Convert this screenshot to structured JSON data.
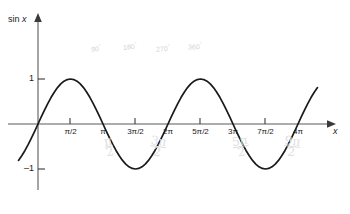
{
  "chart_data": {
    "type": "line",
    "title": "",
    "subtitle": "",
    "function": "sin x",
    "ylabel": "sin x",
    "xlabel": "x",
    "xlim_radians": [
      -0.35,
      4.35
    ],
    "ylim": [
      -1.55,
      1.6
    ],
    "grid": false,
    "legend": false,
    "series": [
      {
        "name": "sin x",
        "color": "#1a1a1a",
        "x_units": "radians (multiples of pi)",
        "x": [
          -0.3,
          -0.25,
          -0.2,
          -0.15,
          -0.1,
          -0.05,
          0.0,
          0.05,
          0.1,
          0.15,
          0.2,
          0.25,
          0.3,
          0.35,
          0.4,
          0.45,
          0.5,
          0.55,
          0.6,
          0.65,
          0.7,
          0.75,
          0.8,
          0.85,
          0.9,
          0.95,
          1.0,
          1.05,
          1.1,
          1.15,
          1.2,
          1.25,
          1.3,
          1.35,
          1.4,
          1.45,
          1.5,
          1.55,
          1.6,
          1.65,
          1.7,
          1.75,
          1.8,
          1.85,
          1.9,
          1.95,
          2.0,
          2.05,
          2.1,
          2.15,
          2.2,
          2.25,
          2.3,
          2.35,
          2.4,
          2.45,
          2.5,
          2.55,
          2.6,
          2.65,
          2.7,
          2.75,
          2.8,
          2.85,
          2.9,
          2.95,
          3.0,
          3.05,
          3.1,
          3.15,
          3.2,
          3.25,
          3.3,
          3.35,
          3.4,
          3.45,
          3.5,
          3.55,
          3.6,
          3.65,
          3.7,
          3.75,
          3.8,
          3.85,
          3.9,
          3.95,
          4.0,
          4.05,
          4.1,
          4.15,
          4.2,
          4.25,
          4.3
        ],
        "y": [
          -0.809,
          -0.707,
          -0.588,
          -0.454,
          -0.309,
          -0.156,
          0.0,
          0.156,
          0.309,
          0.454,
          0.588,
          0.707,
          0.809,
          0.891,
          0.951,
          0.988,
          1.0,
          0.988,
          0.951,
          0.891,
          0.809,
          0.707,
          0.588,
          0.454,
          0.309,
          0.156,
          0.0,
          -0.156,
          -0.309,
          -0.454,
          -0.588,
          -0.707,
          -0.809,
          -0.891,
          -0.951,
          -0.988,
          -1.0,
          -0.988,
          -0.951,
          -0.891,
          -0.809,
          -0.707,
          -0.588,
          -0.454,
          -0.309,
          -0.156,
          0.0,
          0.156,
          0.309,
          0.454,
          0.588,
          0.707,
          0.809,
          0.891,
          0.951,
          0.988,
          1.0,
          0.988,
          0.951,
          0.891,
          0.809,
          0.707,
          0.588,
          0.454,
          0.309,
          0.156,
          0.0,
          -0.156,
          -0.309,
          -0.454,
          -0.588,
          -0.707,
          -0.809,
          -0.891,
          -0.951,
          -0.988,
          -1.0,
          -0.988,
          -0.951,
          -0.891,
          -0.809,
          -0.707,
          -0.588,
          -0.454,
          -0.309,
          -0.156,
          0.0,
          0.156,
          0.309,
          0.454,
          0.588,
          0.707,
          0.809
        ]
      }
    ],
    "x_ticks": [
      {
        "value": 0.5,
        "label": "π/2"
      },
      {
        "value": 1.0,
        "label": "π"
      },
      {
        "value": 1.5,
        "label": "3π/2"
      },
      {
        "value": 2.0,
        "label": "2π"
      },
      {
        "value": 2.5,
        "label": "5π/2"
      },
      {
        "value": 3.0,
        "label": "3π"
      },
      {
        "value": 3.5,
        "label": "7π/2"
      },
      {
        "value": 4.0,
        "label": "4π"
      }
    ],
    "y_ticks": [
      {
        "value": 1,
        "label": "1"
      },
      {
        "value": -1,
        "label": "–1"
      }
    ],
    "annotations_degrees": [
      {
        "label": "90",
        "degree_symbol": "°",
        "x": 0.5
      },
      {
        "label": "180",
        "degree_symbol": "°",
        "x": 1.0
      },
      {
        "label": "270",
        "degree_symbol": "°",
        "x": 1.5
      },
      {
        "label": "360",
        "degree_symbol": "°",
        "x": 2.0
      }
    ],
    "annotations_pencil": [
      {
        "numerator": "π",
        "denominator": "2",
        "x": 1.15
      },
      {
        "numerator": "3π",
        "denominator": "2",
        "x": 1.85
      },
      {
        "numerator": "5π",
        "denominator": "2",
        "x": 3.12
      },
      {
        "numerator": "9π",
        "denominator": "2",
        "x": 3.9
      }
    ]
  },
  "axes": {
    "y_axis_label_prefix": "sin",
    "y_axis_label_var": "x",
    "x_axis_label": "x"
  },
  "colors": {
    "curve": "#1a1a1a",
    "axis": "#5b5b5b",
    "background": "#ffffff",
    "faint_annotation": "#d2d2d2",
    "pencil_annotation": "#dedede"
  }
}
